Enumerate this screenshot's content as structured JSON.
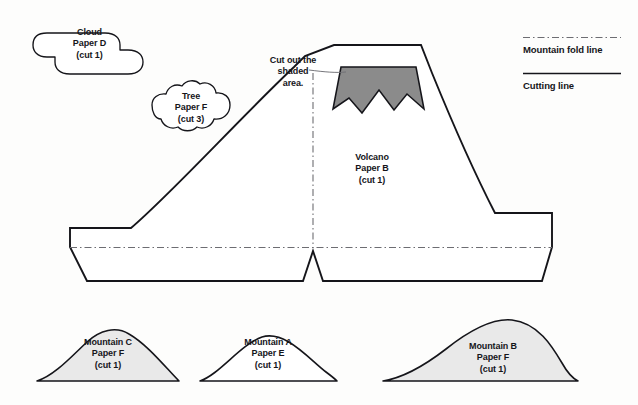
{
  "document": {
    "kind": "papercraft-cutting-template",
    "background_color": "#fdfdfc",
    "ink_color": "#15151a"
  },
  "colors": {
    "outline": "#15151a",
    "fold_line": "#6d6d72",
    "shaded_fill": "#8b8b8b",
    "mountain_fill": "#e9e9e9",
    "piece_fill": "#ffffff",
    "leader_line": "#6f6f74"
  },
  "legend": {
    "items": [
      {
        "label": "Mountain fold line",
        "style": "dash-dot",
        "color": "#6d6d72"
      },
      {
        "label": "Cutting line",
        "style": "solid",
        "color": "#15151a"
      }
    ]
  },
  "annotation": {
    "text": "Cut out the\nshaded\narea.",
    "lines": [
      "Cut out the",
      "shaded",
      "area."
    ]
  },
  "pieces": [
    {
      "id": "cloud-d",
      "name": "Cloud",
      "paper": "Paper D",
      "quantity": "(cut 1)",
      "label_lines": [
        "Cloud",
        "Paper D",
        "(cut 1)"
      ],
      "fill": "#ffffff"
    },
    {
      "id": "tree-f",
      "name": "Tree",
      "paper": "Paper F",
      "quantity": "(cut 3)",
      "label_lines": [
        "Tree",
        "Paper F",
        "(cut 3)"
      ],
      "fill": "#ffffff"
    },
    {
      "id": "volcano-b",
      "name": "Volcano",
      "paper": "Paper B",
      "quantity": "(cut 1)",
      "label_lines": [
        "Volcano",
        "Paper B",
        "(cut 1)"
      ],
      "fill": "#ffffff"
    },
    {
      "id": "mountain-c",
      "name": "Mountain C",
      "paper": "Paper F",
      "quantity": "(cut 1)",
      "label_lines": [
        "Mountain C",
        "Paper F",
        "(cut 1)"
      ],
      "fill": "#e9e9e9"
    },
    {
      "id": "mountain-a",
      "name": "Mountain A",
      "paper": "Paper E",
      "quantity": "(cut 1)",
      "label_lines": [
        "Mountain A",
        "Paper E",
        "(cut 1)"
      ],
      "fill": "#ffffff"
    },
    {
      "id": "mountain-b",
      "name": "Mountain B",
      "paper": "Paper F",
      "quantity": "(cut 1)",
      "label_lines": [
        "Mountain B",
        "Paper F",
        "(cut 1)"
      ],
      "fill": "#e9e9e9"
    }
  ],
  "labels": {
    "cloud_d": "Cloud\nPaper D\n(cut 1)",
    "tree_f": "Tree\nPaper F\n(cut 3)",
    "volcano_b": "Volcano\nPaper B\n(cut 1)",
    "mountain_c": "Mountain C\nPaper F\n(cut 1)",
    "mountain_a": "Mountain A\nPaper E\n(cut 1)",
    "mountain_b": "Mountain B\nPaper F\n(cut 1)",
    "annotation": "Cut out the\nshaded\narea.",
    "legend_fold": "Mountain fold line",
    "legend_cut": "Cutting line"
  }
}
